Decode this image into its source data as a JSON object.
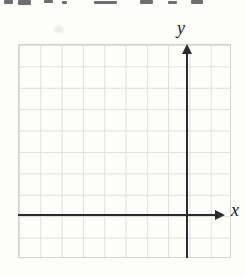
{
  "figure": {
    "colors": {
      "background": "#fdfdfc",
      "grid_line": "#e1ddda",
      "grid_border": "#d6d2cf",
      "axis": "#2b2b2b",
      "label": "#1c1c1c"
    }
  },
  "chart_data": {
    "type": "line",
    "title": "",
    "xlabel": "x",
    "ylabel": "y",
    "series": [],
    "grid": true,
    "grid_columns": 10,
    "grid_rows": 10,
    "origin_grid_position": {
      "column_from_left": 8,
      "row_from_top": 8
    },
    "x_range_cells": [
      -8,
      2
    ],
    "y_range_cells": [
      -2,
      8
    ],
    "axes": [
      {
        "name": "x-axis",
        "label": "x",
        "direction": "right",
        "arrowhead": true
      },
      {
        "name": "y-axis",
        "label": "y",
        "direction": "up",
        "arrowhead": true
      }
    ],
    "legend": false
  },
  "artifacts": {
    "top_cropped_text_marks": [
      {
        "x": 4,
        "y": 0,
        "w": 9,
        "h": 4
      },
      {
        "x": 18,
        "y": 0,
        "w": 13,
        "h": 5
      },
      {
        "x": 44,
        "y": 0,
        "w": 9,
        "h": 3
      },
      {
        "x": 62,
        "y": 1,
        "w": 5,
        "h": 3
      },
      {
        "x": 94,
        "y": 1,
        "w": 23,
        "h": 3
      },
      {
        "x": 140,
        "y": 0,
        "w": 13,
        "h": 4
      },
      {
        "x": 168,
        "y": 1,
        "w": 9,
        "h": 3
      },
      {
        "x": 191,
        "y": 0,
        "w": 12,
        "h": 4
      }
    ]
  }
}
